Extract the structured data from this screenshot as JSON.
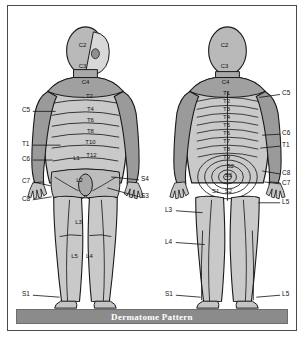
{
  "caption": {
    "text": "Dermatome Pattern"
  },
  "colors": {
    "frame_border": "#4a4a4a",
    "background": "#ffffff",
    "caption_bar": "#8b8b8b",
    "caption_text": "#ffffff",
    "skin_light": "#d2d2d2",
    "skin_mid": "#b9b9b9",
    "skin_dark": "#a0a0a0",
    "outline": "#1a1a1a",
    "label_text": "#111111",
    "leader_line": "#111111"
  },
  "figures": [
    {
      "id": "anterior-figure",
      "view": "anterior",
      "inner_labels": [
        {
          "text": "C2",
          "x": 75,
          "y": 41
        },
        {
          "text": "C3",
          "x": 75,
          "y": 62
        },
        {
          "text": "C4",
          "x": 78,
          "y": 78
        },
        {
          "text": "T2",
          "x": 82,
          "y": 93
        },
        {
          "text": "T4",
          "x": 83,
          "y": 106
        },
        {
          "text": "T6",
          "x": 83,
          "y": 117
        },
        {
          "text": "T8",
          "x": 83,
          "y": 128
        },
        {
          "text": "T10",
          "x": 83,
          "y": 139
        },
        {
          "text": "T12",
          "x": 84,
          "y": 152
        },
        {
          "text": "L1",
          "x": 69,
          "y": 155
        },
        {
          "text": "L2",
          "x": 72,
          "y": 177
        },
        {
          "text": "L3",
          "x": 71,
          "y": 219
        },
        {
          "text": "L5",
          "x": 67,
          "y": 254
        },
        {
          "text": "L4",
          "x": 82,
          "y": 254
        }
      ],
      "leader_labels": [
        {
          "text": "C5",
          "side": "left",
          "tx": 14,
          "ty": 107,
          "lx1": 25,
          "ly1": 106,
          "lx2": 48,
          "ly2": 106
        },
        {
          "text": "T1",
          "side": "left",
          "tx": 14,
          "ty": 141,
          "lx1": 25,
          "ly1": 140,
          "lx2": 53,
          "ly2": 140
        },
        {
          "text": "C6",
          "side": "left",
          "tx": 14,
          "ty": 156,
          "lx1": 25,
          "ly1": 155,
          "lx2": 45,
          "ly2": 155
        },
        {
          "text": "C7",
          "side": "left",
          "tx": 14,
          "ty": 178,
          "lx1": 25,
          "ly1": 177,
          "lx2": 43,
          "ly2": 181
        },
        {
          "text": "C8",
          "side": "left",
          "tx": 14,
          "ty": 196,
          "lx1": 25,
          "ly1": 195,
          "lx2": 44,
          "ly2": 192
        },
        {
          "text": "S1",
          "side": "left",
          "tx": 14,
          "ty": 292,
          "lx1": 25,
          "ly1": 291,
          "lx2": 52,
          "ly2": 293
        },
        {
          "text": "S4",
          "side": "right",
          "tx": 134,
          "ty": 176,
          "lx1": 132,
          "ly1": 175,
          "lx2": 104,
          "ly2": 172
        },
        {
          "text": "S3",
          "side": "right",
          "tx": 134,
          "ty": 193,
          "lx1": 132,
          "ly1": 192,
          "lx2": 100,
          "ly2": 183
        }
      ]
    },
    {
      "id": "posterior-figure",
      "view": "posterior",
      "inner_labels": [
        {
          "text": "C2",
          "x": 218,
          "y": 41
        },
        {
          "text": "C3",
          "x": 218,
          "y": 62
        },
        {
          "text": "C4",
          "x": 219,
          "y": 78
        },
        {
          "text": "T1",
          "x": 220,
          "y": 90
        },
        {
          "text": "T2",
          "x": 220,
          "y": 98
        },
        {
          "text": "T3",
          "x": 220,
          "y": 106
        },
        {
          "text": "T4",
          "x": 220,
          "y": 114
        },
        {
          "text": "T5",
          "x": 220,
          "y": 122
        },
        {
          "text": "T6",
          "x": 220,
          "y": 130
        },
        {
          "text": "T7",
          "x": 220,
          "y": 138
        },
        {
          "text": "T8",
          "x": 220,
          "y": 146
        },
        {
          "text": "T9",
          "x": 220,
          "y": 154
        },
        {
          "text": "S2",
          "x": 224,
          "y": 163
        },
        {
          "text": "S3",
          "x": 222,
          "y": 172
        },
        {
          "text": "S1",
          "x": 209,
          "y": 188
        },
        {
          "text": "S2",
          "x": 222,
          "y": 188
        }
      ],
      "leader_labels": [
        {
          "text": "C5",
          "side": "right",
          "tx": 276,
          "ty": 90,
          "lx1": 274,
          "ly1": 89,
          "lx2": 253,
          "ly2": 92
        },
        {
          "text": "C6",
          "side": "right",
          "tx": 276,
          "ty": 130,
          "lx1": 274,
          "ly1": 129,
          "lx2": 256,
          "ly2": 130
        },
        {
          "text": "T1",
          "side": "right",
          "tx": 276,
          "ty": 142,
          "lx1": 274,
          "ly1": 141,
          "lx2": 254,
          "ly2": 143
        },
        {
          "text": "C8",
          "side": "right",
          "tx": 276,
          "ty": 170,
          "lx1": 274,
          "ly1": 169,
          "lx2": 256,
          "ly2": 166
        },
        {
          "text": "C7",
          "side": "right",
          "tx": 276,
          "ty": 180,
          "lx1": 274,
          "ly1": 179,
          "lx2": 258,
          "ly2": 177
        },
        {
          "text": "L5",
          "side": "right",
          "tx": 276,
          "ty": 199,
          "lx1": 274,
          "ly1": 198,
          "lx2": 252,
          "ly2": 198
        },
        {
          "text": "L3",
          "side": "left",
          "tx": 158,
          "ty": 207,
          "lx1": 169,
          "ly1": 206,
          "lx2": 196,
          "ly2": 208
        },
        {
          "text": "L4",
          "side": "left",
          "tx": 158,
          "ty": 239,
          "lx1": 169,
          "ly1": 238,
          "lx2": 198,
          "ly2": 240
        },
        {
          "text": "S1",
          "side": "left",
          "tx": 158,
          "ty": 292,
          "lx1": 169,
          "ly1": 291,
          "lx2": 194,
          "ly2": 293
        },
        {
          "text": "L5",
          "side": "right",
          "tx": 276,
          "ty": 292,
          "lx1": 274,
          "ly1": 291,
          "lx2": 250,
          "ly2": 293
        }
      ]
    }
  ]
}
